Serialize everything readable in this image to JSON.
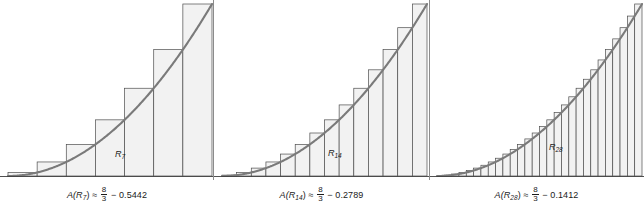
{
  "figure": {
    "background_color": "#ffffff",
    "curve_color": "#7a7a7a",
    "bar_fill_color": "#f2f2f2",
    "bar_stroke_color": "#4d4d4d",
    "baseline_color": "#3d3d3d",
    "text_color": "#1a1a1a",
    "divider_color": "#8c8c8c"
  },
  "panels": [
    {
      "id": "panel-r7",
      "n": 7,
      "inner_label": "R",
      "inner_label_sub": "7",
      "caption": {
        "lead": "A(",
        "symbol": "R",
        "symbol_sub": "7",
        "close": ") ≈",
        "frac_num": "8",
        "frac_den": "3",
        "minus": "−",
        "value": "0.5442",
        "full_text": "A(R7) ≈ 8/3 − 0.5442"
      },
      "label_x": 115,
      "label_y": 149
    },
    {
      "id": "panel-r14",
      "n": 14,
      "inner_label": "R",
      "inner_label_sub": "14",
      "caption": {
        "lead": "A(",
        "symbol": "R",
        "symbol_sub": "14",
        "close": ") ≈",
        "frac_num": "8",
        "frac_den": "3",
        "minus": "−",
        "value": "0.2789",
        "full_text": "A(R14) ≈ 8/3 − 0.2789"
      },
      "label_x": 114,
      "label_y": 148
    },
    {
      "id": "panel-r28",
      "n": 28,
      "inner_label": "R",
      "inner_label_sub": "28",
      "caption": {
        "lead": "A(",
        "symbol": "R",
        "symbol_sub": "28",
        "close": ") ≈",
        "frac_num": "8",
        "frac_den": "3",
        "minus": "−",
        "value": "0.1412",
        "full_text": "A(R28) ≈ 8/3 − 0.1412"
      },
      "label_x": 120,
      "label_y": 142
    }
  ],
  "chart_data": {
    "type": "area",
    "xlabel": "",
    "ylabel": "",
    "grid": false,
    "legend": "none",
    "xlim": [
      0,
      2
    ],
    "ylim": [
      0,
      4
    ],
    "curve": {
      "name": "f(x)",
      "description": "increasing convex curve rising from near 0 at left to the top-right of each panel",
      "x": [
        0,
        0.2,
        0.4,
        0.6,
        0.8,
        1.0,
        1.2,
        1.4,
        1.6,
        1.8,
        2.0
      ],
      "y": [
        0.0,
        0.04,
        0.16,
        0.36,
        0.64,
        1.0,
        1.44,
        1.96,
        2.56,
        3.24,
        4.0
      ]
    },
    "exact_area": 2.6667,
    "exact_area_text": "8/3",
    "series": [
      {
        "name": "R7",
        "n_rectangles": 7,
        "error": 0.5442,
        "approx_value": 2.1225,
        "right_endpoints": [
          0.2857,
          0.5714,
          0.8571,
          1.1429,
          1.4286,
          1.7143,
          2.0
        ],
        "values": [
          0.0816,
          0.3265,
          0.7347,
          1.3061,
          2.0408,
          2.9388,
          4.0
        ]
      },
      {
        "name": "R14",
        "n_rectangles": 14,
        "error": 0.2789,
        "approx_value": 2.3878,
        "right_endpoints": [
          0.1429,
          0.2857,
          0.4286,
          0.5714,
          0.7143,
          0.8571,
          1.0,
          1.1429,
          1.2857,
          1.4286,
          1.5714,
          1.7143,
          1.8571,
          2.0
        ],
        "values": [
          0.0204,
          0.0816,
          0.1837,
          0.3265,
          0.5102,
          0.7347,
          1.0,
          1.3061,
          1.6531,
          2.0408,
          2.4694,
          2.9388,
          3.449,
          4.0
        ]
      },
      {
        "name": "R28",
        "n_rectangles": 28,
        "error": 0.1412,
        "approx_value": 2.5255,
        "right_endpoints": [
          0.0714,
          0.1429,
          0.2143,
          0.2857,
          0.3571,
          0.4286,
          0.5,
          0.5714,
          0.6429,
          0.7143,
          0.7857,
          0.8571,
          0.9286,
          1.0,
          1.0714,
          1.1429,
          1.2143,
          1.2857,
          1.3571,
          1.4286,
          1.5,
          1.5714,
          1.6429,
          1.7143,
          1.7857,
          1.8571,
          1.9286,
          2.0
        ],
        "values": [
          0.0051,
          0.0204,
          0.0459,
          0.0816,
          0.1276,
          0.1837,
          0.25,
          0.3265,
          0.4133,
          0.5102,
          0.6173,
          0.7347,
          0.8622,
          1.0,
          1.148,
          1.3061,
          1.4745,
          1.6531,
          1.8418,
          2.0408,
          2.25,
          2.4694,
          2.699,
          2.9388,
          3.1888,
          3.449,
          3.7194,
          4.0
        ]
      }
    ]
  }
}
